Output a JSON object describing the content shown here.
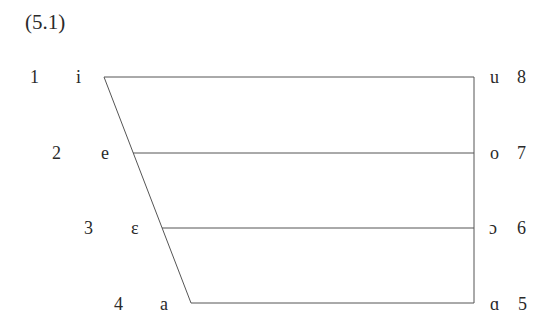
{
  "equation_number": "(5.1)",
  "vowels": [
    {
      "num": "1",
      "symbol": "i",
      "side": "left"
    },
    {
      "num": "2",
      "symbol": "e",
      "side": "left"
    },
    {
      "num": "3",
      "symbol": "ɛ",
      "side": "left"
    },
    {
      "num": "4",
      "symbol": "a",
      "side": "left"
    },
    {
      "num": "5",
      "symbol": "ɑ",
      "side": "right"
    },
    {
      "num": "6",
      "symbol": "ɔ",
      "side": "right"
    },
    {
      "num": "7",
      "symbol": "o",
      "side": "right"
    },
    {
      "num": "8",
      "symbol": "u",
      "side": "right"
    }
  ],
  "line_color": "#555555"
}
